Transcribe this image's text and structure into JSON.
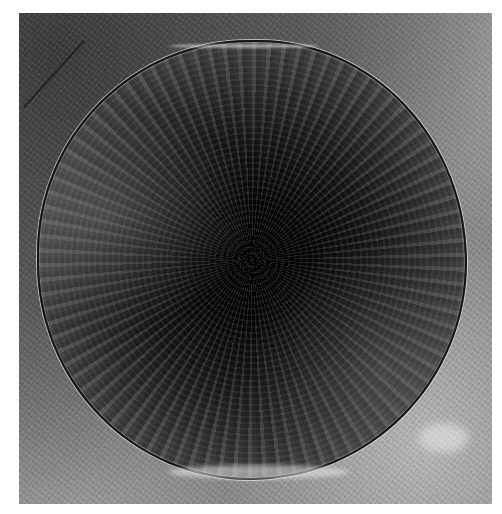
{
  "image": {
    "description": "Grayscale micrograph of a large circular dark structure with radial texture, outlined by a thin dark boundary with a bright halo, on a mottled gray background",
    "colors": {
      "background_page": "#ffffff",
      "surround_gray": "#8c8c8c",
      "disc_center": "#000000",
      "disc_edge": "#6a6a6a",
      "boundary_line": "#151515",
      "halo": "#e6e6e6"
    }
  }
}
